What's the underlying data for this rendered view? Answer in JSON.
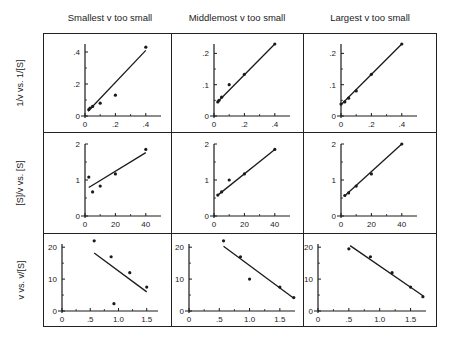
{
  "column_titles": [
    "Smallest v too small",
    "Middlemost v too small",
    "Largest v too small"
  ],
  "row_labels": [
    "1/v vs. 1/[S]",
    "[S]/v vs. [S]",
    "v vs. v/[S]"
  ],
  "chart_data": [
    {
      "type": "scatter",
      "panel": "row1-col1",
      "title": "Smallest v too small",
      "ylabel": "1/v vs. 1/[S]",
      "xlim": [
        0,
        0.5
      ],
      "ylim": [
        0,
        0.45
      ],
      "xticks": [
        "0",
        ".2",
        ".4"
      ],
      "yticks": [
        "0",
        ".2",
        ".4"
      ],
      "points": [
        [
          0.025,
          0.04
        ],
        [
          0.033,
          0.05
        ],
        [
          0.05,
          0.06
        ],
        [
          0.1,
          0.08
        ],
        [
          0.2,
          0.13
        ],
        [
          0.4,
          0.43
        ]
      ],
      "fit_line": [
        [
          0.02,
          0.03
        ],
        [
          0.4,
          0.41
        ]
      ]
    },
    {
      "type": "scatter",
      "panel": "row1-col2",
      "title": "Middlemost v too small",
      "ylabel": "1/v vs. 1/[S]",
      "xlim": [
        0,
        0.5
      ],
      "ylim": [
        0,
        0.23
      ],
      "xticks": [
        "0",
        ".2",
        ".4"
      ],
      "yticks": [
        "0",
        ".1",
        ".2"
      ],
      "points": [
        [
          0.025,
          0.045
        ],
        [
          0.033,
          0.05
        ],
        [
          0.05,
          0.06
        ],
        [
          0.1,
          0.1
        ],
        [
          0.2,
          0.133
        ],
        [
          0.4,
          0.23
        ]
      ],
      "fit_line": [
        [
          0.02,
          0.043
        ],
        [
          0.4,
          0.23
        ]
      ]
    },
    {
      "type": "scatter",
      "panel": "row1-col3",
      "title": "Largest v too small",
      "ylabel": "1/v vs. 1/[S]",
      "xlim": [
        0,
        0.5
      ],
      "ylim": [
        0,
        0.23
      ],
      "xticks": [
        "0",
        ".2",
        ".4"
      ],
      "yticks": [
        "0",
        ".1",
        ".2"
      ],
      "points": [
        [
          0.0,
          0.038
        ],
        [
          0.025,
          0.045
        ],
        [
          0.05,
          0.057
        ],
        [
          0.1,
          0.08
        ],
        [
          0.2,
          0.133
        ],
        [
          0.4,
          0.23
        ]
      ],
      "fit_line": [
        [
          0.0,
          0.036
        ],
        [
          0.4,
          0.23
        ]
      ]
    },
    {
      "type": "scatter",
      "panel": "row2-col1",
      "title": "Smallest v too small",
      "ylabel": "[S]/v vs. [S]",
      "xlim": [
        0,
        50
      ],
      "ylim": [
        0,
        2
      ],
      "xticks": [
        "0",
        "20",
        "40"
      ],
      "yticks": [
        "0",
        "1",
        "2"
      ],
      "points": [
        [
          2.5,
          1.08
        ],
        [
          5,
          0.67
        ],
        [
          10,
          0.83
        ],
        [
          20,
          1.17
        ],
        [
          40,
          1.85
        ]
      ],
      "fit_line": [
        [
          2.5,
          0.79
        ],
        [
          40,
          1.76
        ]
      ]
    },
    {
      "type": "scatter",
      "panel": "row2-col2",
      "title": "Middlemost v too small",
      "ylabel": "[S]/v vs. [S]",
      "xlim": [
        0,
        50
      ],
      "ylim": [
        0,
        2
      ],
      "xticks": [
        "0",
        "20",
        "40"
      ],
      "yticks": [
        "0",
        "1",
        "2"
      ],
      "points": [
        [
          2.5,
          0.58
        ],
        [
          5,
          0.67
        ],
        [
          10,
          1.0
        ],
        [
          20,
          1.17
        ],
        [
          40,
          1.85
        ]
      ],
      "fit_line": [
        [
          2.5,
          0.58
        ],
        [
          40,
          1.85
        ]
      ]
    },
    {
      "type": "scatter",
      "panel": "row2-col3",
      "title": "Largest v too small",
      "ylabel": "[S]/v vs. [S]",
      "xlim": [
        0,
        50
      ],
      "ylim": [
        0,
        2
      ],
      "xticks": [
        "0",
        "20",
        "40"
      ],
      "yticks": [
        "0",
        "1",
        "2"
      ],
      "points": [
        [
          2.5,
          0.57
        ],
        [
          5,
          0.64
        ],
        [
          10,
          0.83
        ],
        [
          20,
          1.17
        ],
        [
          40,
          2.0
        ]
      ],
      "fit_line": [
        [
          2.5,
          0.56
        ],
        [
          40,
          2.0
        ]
      ]
    },
    {
      "type": "scatter",
      "panel": "row3-col1",
      "title": "Smallest v too small",
      "ylabel": "v vs. v/[S]",
      "xlim": [
        0,
        1.7
      ],
      "ylim": [
        0,
        21
      ],
      "xticks": [
        "0",
        ".5",
        "1.0",
        "1.5"
      ],
      "yticks": [
        "0",
        "10",
        "20"
      ],
      "points": [
        [
          0.57,
          22
        ],
        [
          0.87,
          17
        ],
        [
          0.92,
          2.3
        ],
        [
          1.2,
          12
        ],
        [
          1.5,
          7.5
        ]
      ],
      "fit_line": [
        [
          0.57,
          18.2
        ],
        [
          1.5,
          6
        ]
      ]
    },
    {
      "type": "scatter",
      "panel": "row3-col2",
      "title": "Middlemost v too small",
      "ylabel": "v vs. v/[S]",
      "xlim": [
        0,
        1.75
      ],
      "ylim": [
        0,
        21
      ],
      "xticks": [
        "0",
        ".5",
        "1.0",
        "1.5"
      ],
      "yticks": [
        "0",
        "10",
        "20"
      ],
      "points": [
        [
          0.57,
          22
        ],
        [
          0.85,
          17
        ],
        [
          1.0,
          10
        ],
        [
          1.5,
          7.5
        ],
        [
          1.73,
          4.2
        ]
      ],
      "fit_line": [
        [
          0.57,
          20.3
        ],
        [
          1.73,
          4
        ]
      ]
    },
    {
      "type": "scatter",
      "panel": "row3-col3",
      "title": "Largest v too small",
      "ylabel": "v vs. v/[S]",
      "xlim": [
        0,
        1.75
      ],
      "ylim": [
        0,
        21
      ],
      "xticks": [
        "0",
        ".5",
        "1.0",
        "1.5"
      ],
      "yticks": [
        "0",
        "10",
        "20"
      ],
      "points": [
        [
          0.5,
          19.5
        ],
        [
          0.85,
          17
        ],
        [
          1.2,
          12
        ],
        [
          1.5,
          7.5
        ],
        [
          1.7,
          4.5
        ]
      ],
      "fit_line": [
        [
          0.52,
          20.5
        ],
        [
          1.7,
          4.8
        ]
      ]
    }
  ]
}
